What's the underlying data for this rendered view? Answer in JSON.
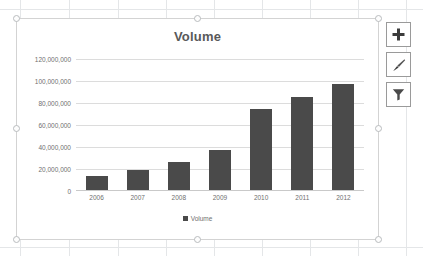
{
  "chart_data": {
    "type": "bar",
    "title": "Volume",
    "xlabel": "",
    "ylabel": "",
    "categories": [
      "2006",
      "2007",
      "2008",
      "2009",
      "2010",
      "2011",
      "2012"
    ],
    "series": [
      {
        "name": "Volume",
        "values": [
          13500000,
          19000000,
          26500000,
          37000000,
          75000000,
          85500000,
          97000000
        ]
      }
    ],
    "ylim": [
      0,
      120000000
    ],
    "ytick_values": [
      0,
      20000000,
      40000000,
      60000000,
      80000000,
      100000000,
      120000000
    ],
    "ytick_labels": [
      "0",
      "20,000,000",
      "40,000,000",
      "60,000,000",
      "80,000,000",
      "100,000,000",
      "120,000,000"
    ],
    "grid": true,
    "legend_position": "bottom",
    "legend_entries": [
      "Volume"
    ],
    "series_color": "#4a4a4a",
    "title_color": "#595959",
    "gridline_color": "#dcdcdc",
    "tick_label_color": "#6f6f6f"
  },
  "chart_object": {
    "selected": true,
    "border_color": "#d3d3d3",
    "handle_fill": "#fdfdfd",
    "handle_border": "#b9bcbe"
  },
  "chart_tools": [
    {
      "name": "chart-elements-button",
      "icon": "plus-icon",
      "label": "+"
    },
    {
      "name": "chart-styles-button",
      "icon": "paintbrush-icon",
      "label": ""
    },
    {
      "name": "chart-filters-button",
      "icon": "funnel-icon",
      "label": ""
    }
  ],
  "worksheet": {
    "gridline_color": "#e4e6e8",
    "column_x": [
      20,
      69,
      118,
      166,
      214,
      262,
      310,
      358,
      406
    ],
    "row_y": [
      9,
      247
    ]
  }
}
